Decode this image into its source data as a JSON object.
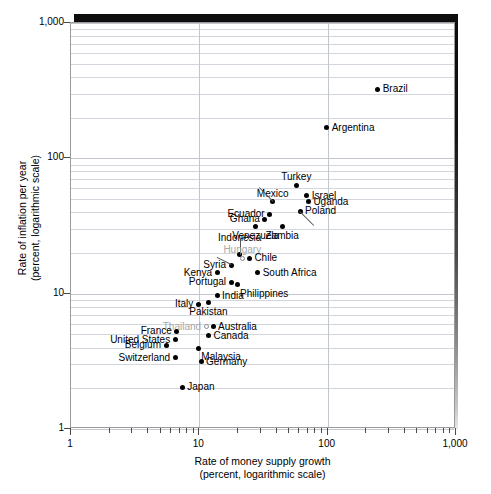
{
  "chart_data": {
    "type": "scatter",
    "title": "",
    "xlabel": "Rate of money supply growth\n(percent, logarithmic scale)",
    "xlabel_line1": "Rate of money supply growth",
    "xlabel_line2": "(percent, logarithmic scale)",
    "ylabel_line1": "Rate of inflation per year",
    "ylabel_line2": "(percent, logarithmic scale)",
    "xscale": "log",
    "yscale": "log",
    "xlim": [
      1,
      1000
    ],
    "ylim": [
      1,
      1000
    ],
    "grid": true,
    "legend": "none",
    "xticks": [
      "1",
      "10",
      "100",
      "1,000"
    ],
    "yticks": [
      "1",
      "10",
      "100",
      "1,000"
    ],
    "points": [
      {
        "name": "Brazil",
        "x": 250,
        "y": 320,
        "marker": "filled",
        "label_pos": "right"
      },
      {
        "name": "Argentina",
        "x": 100,
        "y": 165,
        "marker": "filled",
        "label_pos": "right"
      },
      {
        "name": "Turkey",
        "x": 58,
        "y": 62,
        "marker": "filled",
        "label_pos": "above"
      },
      {
        "name": "Israel",
        "x": 70,
        "y": 52,
        "marker": "filled",
        "label_pos": "right"
      },
      {
        "name": "Mexico",
        "x": 38,
        "y": 47,
        "marker": "filled",
        "label_pos": "leader-up-left"
      },
      {
        "name": "Uganda",
        "x": 72,
        "y": 47,
        "marker": "filled",
        "label_pos": "right"
      },
      {
        "name": "Ecuador",
        "x": 36,
        "y": 38,
        "marker": "filled",
        "label_pos": "left"
      },
      {
        "name": "Poland",
        "x": 62,
        "y": 40,
        "marker": "filled",
        "label_pos": "leader-down-right"
      },
      {
        "name": "Ghana",
        "x": 33,
        "y": 35,
        "marker": "filled",
        "label_pos": "left"
      },
      {
        "name": "Venezuela",
        "x": 28,
        "y": 31,
        "marker": "filled",
        "label_pos": "below"
      },
      {
        "name": "Zambia",
        "x": 45,
        "y": 31,
        "marker": "filled",
        "label_pos": "below"
      },
      {
        "name": "Indonesia",
        "x": 21,
        "y": 19,
        "marker": "filled",
        "label_pos": "leader-up"
      },
      {
        "name": "Hungary",
        "x": 22,
        "y": 18,
        "marker": "hollow",
        "label_pos": "above",
        "muted": true
      },
      {
        "name": "Chile",
        "x": 25,
        "y": 18,
        "marker": "filled",
        "label_pos": "right"
      },
      {
        "name": "Syria",
        "x": 18,
        "y": 16,
        "marker": "filled",
        "label_pos": "leader-left"
      },
      {
        "name": "Kenya",
        "x": 14,
        "y": 14,
        "marker": "filled",
        "label_pos": "left"
      },
      {
        "name": "South Africa",
        "x": 29,
        "y": 14,
        "marker": "filled",
        "label_pos": "right"
      },
      {
        "name": "Portugal",
        "x": 18,
        "y": 12,
        "marker": "filled",
        "label_pos": "left"
      },
      {
        "name": "Philippines",
        "x": 20,
        "y": 11.5,
        "marker": "filled",
        "label_pos": "below-right"
      },
      {
        "name": "India",
        "x": 14,
        "y": 9.5,
        "marker": "filled",
        "label_pos": "right"
      },
      {
        "name": "Italy",
        "x": 10,
        "y": 8.2,
        "marker": "filled",
        "label_pos": "left"
      },
      {
        "name": "Pakistan",
        "x": 12,
        "y": 8.5,
        "marker": "filled",
        "label_pos": "below"
      },
      {
        "name": "Thailand",
        "x": 11.5,
        "y": 5.6,
        "marker": "hollow",
        "label_pos": "left",
        "muted": true
      },
      {
        "name": "Australia",
        "x": 13,
        "y": 5.6,
        "marker": "filled",
        "label_pos": "right"
      },
      {
        "name": "France",
        "x": 6.8,
        "y": 5.2,
        "marker": "filled",
        "label_pos": "left"
      },
      {
        "name": "Canada",
        "x": 12,
        "y": 4.8,
        "marker": "filled",
        "label_pos": "right"
      },
      {
        "name": "United States",
        "x": 6.6,
        "y": 4.5,
        "marker": "filled",
        "label_pos": "left"
      },
      {
        "name": "Belgium",
        "x": 5.6,
        "y": 4.1,
        "marker": "filled",
        "label_pos": "left"
      },
      {
        "name": "Malaysia",
        "x": 10,
        "y": 3.9,
        "marker": "filled",
        "label_pos": "below-right"
      },
      {
        "name": "Switzerland",
        "x": 6.6,
        "y": 3.3,
        "marker": "filled",
        "label_pos": "left"
      },
      {
        "name": "Germany",
        "x": 10.5,
        "y": 3.1,
        "marker": "filled",
        "label_pos": "right"
      },
      {
        "name": "Japan",
        "x": 7.5,
        "y": 2.0,
        "marker": "filled",
        "label_pos": "right"
      }
    ]
  }
}
